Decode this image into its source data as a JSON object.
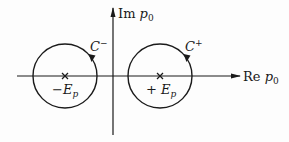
{
  "diagram": {
    "type": "complex-plane-contour",
    "axes": {
      "imag_label_prefix": "Im",
      "imag_label_var": "p",
      "imag_label_sub": "0",
      "real_label_prefix": "Re",
      "real_label_var": "p",
      "real_label_sub": "0"
    },
    "poles": [
      {
        "id": "neg",
        "sign": "−",
        "var": "E",
        "sub": "p"
      },
      {
        "id": "pos",
        "sign": "+ ",
        "var": "E",
        "sub": "p"
      }
    ],
    "contours": [
      {
        "id": "c-minus",
        "name": "C",
        "sup": "−",
        "direction": "clockwise",
        "encircles": "neg"
      },
      {
        "id": "c-plus",
        "name": "C",
        "sup": "+",
        "direction": "clockwise",
        "encircles": "pos"
      }
    ],
    "colors": {
      "stroke": "#1a1a1a",
      "background": "#fdfdfd"
    }
  }
}
